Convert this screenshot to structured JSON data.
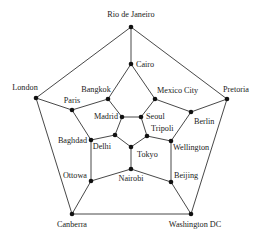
{
  "diagram": {
    "type": "graph",
    "colors": {
      "edge": "#333333",
      "node": "#111111",
      "label": "#222222",
      "background": "#ffffff"
    },
    "nodes": [
      {
        "id": "rio",
        "label": "Rio de Janeiro",
        "x": 131,
        "y": 27,
        "lx": 131,
        "ly": 17,
        "anchor": "middle"
      },
      {
        "id": "cairo",
        "label": "Cairo",
        "x": 131,
        "y": 64,
        "lx": 136,
        "ly": 67,
        "anchor": "start"
      },
      {
        "id": "london",
        "label": "London",
        "x": 36,
        "y": 98,
        "lx": 25,
        "ly": 90,
        "anchor": "middle"
      },
      {
        "id": "pretoria",
        "label": "Pretoria",
        "x": 227,
        "y": 99,
        "lx": 236,
        "ly": 92,
        "anchor": "middle"
      },
      {
        "id": "paris",
        "label": "Paris",
        "x": 72,
        "y": 110,
        "lx": 72,
        "ly": 103,
        "anchor": "middle"
      },
      {
        "id": "bangkok",
        "label": "Bangkok",
        "x": 108,
        "y": 99,
        "lx": 96,
        "ly": 92,
        "anchor": "middle"
      },
      {
        "id": "mexico",
        "label": "Mexico City",
        "x": 155,
        "y": 99,
        "lx": 157,
        "ly": 93,
        "anchor": "start"
      },
      {
        "id": "berlin",
        "label": "Berlin",
        "x": 191,
        "y": 112,
        "lx": 194,
        "ly": 124,
        "anchor": "start"
      },
      {
        "id": "madrid",
        "label": "Madrid",
        "x": 122,
        "y": 117,
        "lx": 118,
        "ly": 119,
        "anchor": "end"
      },
      {
        "id": "seoul",
        "label": "Seoul",
        "x": 141,
        "y": 117,
        "lx": 146,
        "ly": 119,
        "anchor": "start"
      },
      {
        "id": "tripoli",
        "label": "Tripoli",
        "x": 147,
        "y": 136,
        "lx": 151,
        "ly": 131,
        "anchor": "start"
      },
      {
        "id": "delhi",
        "label": "Delhi",
        "x": 115,
        "y": 135,
        "lx": 111,
        "ly": 149,
        "anchor": "end"
      },
      {
        "id": "baghdad",
        "label": "Baghdad",
        "x": 91,
        "y": 140,
        "lx": 87,
        "ly": 143,
        "anchor": "end"
      },
      {
        "id": "wellington",
        "label": "Wellington",
        "x": 171,
        "y": 141,
        "lx": 173,
        "ly": 150,
        "anchor": "start"
      },
      {
        "id": "tokyo",
        "label": "Tokyo",
        "x": 131,
        "y": 147,
        "lx": 137,
        "ly": 157,
        "anchor": "start"
      },
      {
        "id": "nairobi",
        "label": "Nairobi",
        "x": 131,
        "y": 169,
        "lx": 131,
        "ly": 181,
        "anchor": "middle"
      },
      {
        "id": "ottowa",
        "label": "Ottowa",
        "x": 91,
        "y": 181,
        "lx": 87,
        "ly": 178,
        "anchor": "end"
      },
      {
        "id": "beijing",
        "label": "Beijing",
        "x": 171,
        "y": 182,
        "lx": 174,
        "ly": 178,
        "anchor": "start"
      },
      {
        "id": "canberra",
        "label": "Canberra",
        "x": 72,
        "y": 214,
        "lx": 72,
        "ly": 227,
        "anchor": "middle"
      },
      {
        "id": "washington",
        "label": "Washington DC",
        "x": 191,
        "y": 214,
        "lx": 195,
        "ly": 227,
        "anchor": "middle"
      }
    ],
    "edges": [
      [
        "rio",
        "london"
      ],
      [
        "rio",
        "cairo"
      ],
      [
        "rio",
        "pretoria"
      ],
      [
        "london",
        "paris"
      ],
      [
        "london",
        "canberra"
      ],
      [
        "pretoria",
        "berlin"
      ],
      [
        "pretoria",
        "washington"
      ],
      [
        "canberra",
        "washington"
      ],
      [
        "cairo",
        "bangkok"
      ],
      [
        "cairo",
        "mexico"
      ],
      [
        "paris",
        "bangkok"
      ],
      [
        "paris",
        "baghdad"
      ],
      [
        "bangkok",
        "madrid"
      ],
      [
        "mexico",
        "seoul"
      ],
      [
        "mexico",
        "berlin"
      ],
      [
        "berlin",
        "wellington"
      ],
      [
        "madrid",
        "seoul"
      ],
      [
        "madrid",
        "delhi"
      ],
      [
        "seoul",
        "tripoli"
      ],
      [
        "delhi",
        "baghdad"
      ],
      [
        "delhi",
        "tokyo"
      ],
      [
        "tripoli",
        "tokyo"
      ],
      [
        "tripoli",
        "wellington"
      ],
      [
        "tokyo",
        "nairobi"
      ],
      [
        "baghdad",
        "ottowa"
      ],
      [
        "wellington",
        "beijing"
      ],
      [
        "nairobi",
        "ottowa"
      ],
      [
        "nairobi",
        "beijing"
      ],
      [
        "ottowa",
        "canberra"
      ],
      [
        "beijing",
        "washington"
      ]
    ]
  }
}
